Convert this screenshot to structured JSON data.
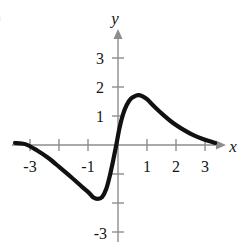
{
  "figure": {
    "label": ")",
    "background_color": "#ffffff",
    "curve_color": "#111111",
    "axis_color": "#8d8d8d",
    "text_color": "#151515"
  },
  "chart_data": {
    "type": "line",
    "title": "",
    "subtitle": "",
    "xlabel": "x",
    "ylabel": "y",
    "xlim": [
      -3.6,
      3.6
    ],
    "ylim": [
      -3.4,
      3.6
    ],
    "grid": false,
    "legend": null,
    "x_ticks": [
      -3,
      -2,
      -1,
      1,
      2,
      3
    ],
    "x_tick_labels": [
      "-3",
      "",
      "-1",
      "1",
      "2",
      "3"
    ],
    "y_ticks": [
      3,
      2,
      1,
      -1,
      -2,
      -3
    ],
    "y_tick_labels": [
      "3",
      "2",
      "1",
      "",
      "",
      "-3"
    ],
    "axis_arrows": [
      "x-positive",
      "y-positive"
    ],
    "series": [
      {
        "name": "f",
        "points": [
          [
            -3.55,
            0.07
          ],
          [
            -3.2,
            0.03
          ],
          [
            -2.8,
            -0.18
          ],
          [
            -2.4,
            -0.45
          ],
          [
            -2.0,
            -0.78
          ],
          [
            -1.6,
            -1.12
          ],
          [
            -1.2,
            -1.48
          ],
          [
            -1.0,
            -1.65
          ],
          [
            -0.86,
            -1.8
          ],
          [
            -0.7,
            -1.86
          ],
          [
            -0.55,
            -1.8
          ],
          [
            -0.4,
            -1.5
          ],
          [
            -0.28,
            -1.05
          ],
          [
            -0.17,
            -0.55
          ],
          [
            -0.06,
            0.0
          ],
          [
            0.05,
            0.58
          ],
          [
            0.17,
            1.05
          ],
          [
            0.3,
            1.38
          ],
          [
            0.45,
            1.6
          ],
          [
            0.62,
            1.7
          ],
          [
            0.72,
            1.72
          ],
          [
            0.85,
            1.68
          ],
          [
            1.0,
            1.58
          ],
          [
            1.25,
            1.33
          ],
          [
            1.55,
            1.05
          ],
          [
            1.9,
            0.76
          ],
          [
            2.25,
            0.53
          ],
          [
            2.6,
            0.34
          ],
          [
            2.95,
            0.2
          ],
          [
            3.25,
            0.1
          ],
          [
            3.35,
            0.07
          ]
        ]
      }
    ],
    "annotations": [
      {
        "text": "local minimum",
        "x": -0.7,
        "y": -1.86
      },
      {
        "text": "local maximum",
        "x": 0.72,
        "y": 1.72
      }
    ]
  }
}
